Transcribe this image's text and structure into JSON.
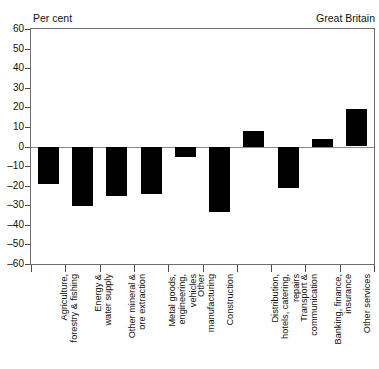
{
  "header": {
    "left_label": "Per cent",
    "right_label": "Great Britain"
  },
  "chart_data": {
    "type": "bar",
    "title": "",
    "subtitle": "",
    "xlabel": "",
    "ylabel": "Per cent",
    "region_label": "Great Britain",
    "ylim": [
      -60,
      60
    ],
    "ytick_step": 10,
    "yticks": [
      60,
      50,
      40,
      30,
      20,
      10,
      0,
      -10,
      -20,
      -30,
      -40,
      -50,
      -60
    ],
    "ytick_labels": [
      "60",
      "50",
      "40",
      "30",
      "20",
      "10",
      "0",
      "-10",
      "-20",
      "-30",
      "-40",
      "-50",
      "-60"
    ],
    "grid": false,
    "legend": null,
    "bar_color": "#000000",
    "axis_color": "#6f6f6f",
    "zero_line_color": "#8a8a8a",
    "categories": [
      "Agriculture, forestry & fishing",
      "Energy & water supply",
      "Other mineral & ore extraction",
      "Metal goods, engineering, vehicles",
      "Other manufacturing",
      "Construction",
      "Distribution, hotels, catering, repairs",
      "Transport & communication",
      "Banking, finance, insurance",
      "Other services"
    ],
    "category_label_lines": [
      [
        "Agriculture,",
        "forestry & fishing"
      ],
      [
        "Energy &",
        "water supply"
      ],
      [
        "Other mineral &",
        "ore extraction"
      ],
      [
        "Metal goods,",
        "engineering,",
        "vehicles"
      ],
      [
        "Other",
        "manufacturing"
      ],
      [
        "Construction"
      ],
      [
        "Distribution,",
        "hotels, catering,",
        "repairs"
      ],
      [
        "Transport &",
        "communication"
      ],
      [
        "Banking, finance,",
        "insurance"
      ],
      [
        "Other services"
      ]
    ],
    "values": [
      -19,
      -30,
      -25,
      -24,
      -5,
      -33,
      8,
      -21,
      4,
      19
    ]
  }
}
